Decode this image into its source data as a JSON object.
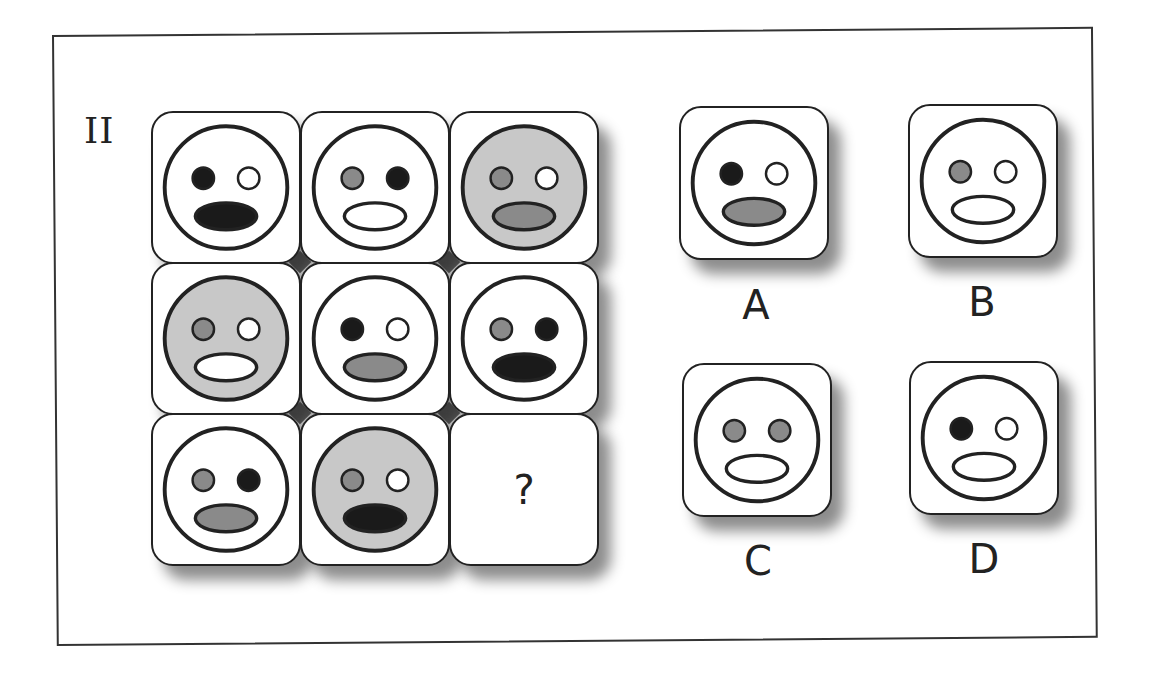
{
  "puzzle": {
    "number": "II",
    "missing_symbol": "?",
    "colors": {
      "black": "#1a1a1a",
      "gray": "#8a8a8a",
      "light_gray": "#c8c8c8",
      "white": "#ffffff",
      "stroke": "#222222"
    },
    "grid": [
      {
        "row": 1,
        "col": 1,
        "face": "white",
        "left_eye": "black",
        "right_eye": "white",
        "mouth": "black"
      },
      {
        "row": 1,
        "col": 2,
        "face": "white",
        "left_eye": "gray",
        "right_eye": "black",
        "mouth": "white"
      },
      {
        "row": 1,
        "col": 3,
        "face": "light_gray",
        "left_eye": "gray",
        "right_eye": "white",
        "mouth": "gray"
      },
      {
        "row": 2,
        "col": 1,
        "face": "light_gray",
        "left_eye": "gray",
        "right_eye": "white",
        "mouth": "white"
      },
      {
        "row": 2,
        "col": 2,
        "face": "white",
        "left_eye": "black",
        "right_eye": "white",
        "mouth": "gray"
      },
      {
        "row": 2,
        "col": 3,
        "face": "white",
        "left_eye": "gray",
        "right_eye": "black",
        "mouth": "black"
      },
      {
        "row": 3,
        "col": 1,
        "face": "white",
        "left_eye": "gray",
        "right_eye": "black",
        "mouth": "gray"
      },
      {
        "row": 3,
        "col": 2,
        "face": "light_gray",
        "left_eye": "gray",
        "right_eye": "white",
        "mouth": "black"
      },
      {
        "row": 3,
        "col": 3,
        "face": null,
        "missing": true
      }
    ],
    "options": [
      {
        "label": "A",
        "face": "white",
        "left_eye": "black",
        "right_eye": "white",
        "mouth": "gray"
      },
      {
        "label": "B",
        "face": "white",
        "left_eye": "gray",
        "right_eye": "white",
        "mouth": "white"
      },
      {
        "label": "C",
        "face": "white",
        "left_eye": "gray",
        "right_eye": "gray",
        "mouth": "white"
      },
      {
        "label": "D",
        "face": "white",
        "left_eye": "black",
        "right_eye": "white",
        "mouth": "white"
      }
    ]
  }
}
